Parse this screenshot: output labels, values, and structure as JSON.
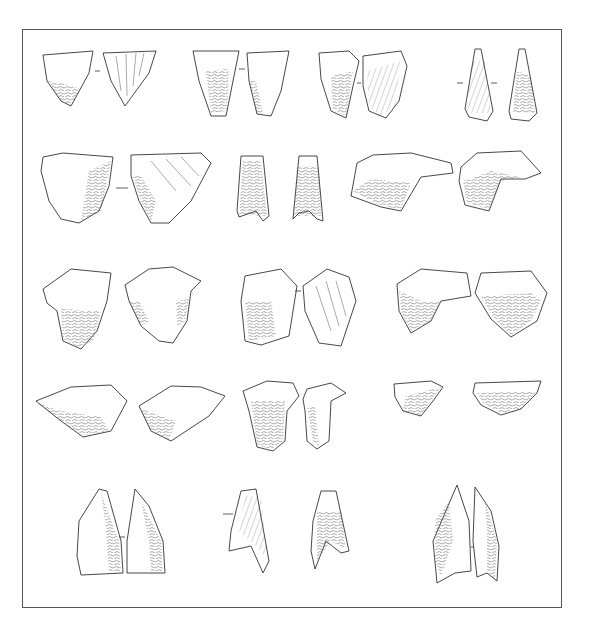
{
  "plate": {
    "type": "lithic-illustration-plate",
    "frame": {
      "x": 22,
      "y": 29,
      "width": 540,
      "height": 579,
      "border_color": "#555555"
    },
    "background": "#ffffff",
    "ink_color": "#333333",
    "rows": [
      {
        "row": 1,
        "artifacts": [
          {
            "id": "r1a1",
            "shape": "triangular",
            "views": 2
          },
          {
            "id": "r1a2",
            "shape": "trapezoidal-elongated",
            "views": 2
          },
          {
            "id": "r1a3",
            "shape": "sub-triangular",
            "views": 2
          },
          {
            "id": "r1a4",
            "shape": "narrow-triangular-point",
            "views": 2
          }
        ]
      },
      {
        "row": 2,
        "artifacts": [
          {
            "id": "r2a1",
            "shape": "broad-triangular",
            "views": 2
          },
          {
            "id": "r2a2",
            "shape": "concave-base-triangle",
            "views": 2
          },
          {
            "id": "r2a3",
            "shape": "transverse-wide",
            "views": 2
          }
        ]
      },
      {
        "row": 3,
        "artifacts": [
          {
            "id": "r3a1",
            "shape": "triangular-shouldered",
            "views": 2
          },
          {
            "id": "r3a2",
            "shape": "sub-rectangular",
            "views": 2
          },
          {
            "id": "r3a3",
            "shape": "transverse-triangular",
            "views": 2
          }
        ]
      },
      {
        "row": 4,
        "artifacts": [
          {
            "id": "r4a1",
            "shape": "flat-rhomboid",
            "views": 2
          },
          {
            "id": "r4a2",
            "shape": "winged-tanged",
            "views": 2
          },
          {
            "id": "r4a3",
            "shape": "transverse-trapeze",
            "views": 2
          }
        ]
      },
      {
        "row": 5,
        "artifacts": [
          {
            "id": "r5a1",
            "shape": "triangular-point",
            "views": 2
          },
          {
            "id": "r5a2",
            "shape": "concave-base-point",
            "views": 2
          },
          {
            "id": "r5a3",
            "shape": "leaf-point",
            "views": 2
          }
        ]
      }
    ],
    "labels": []
  }
}
